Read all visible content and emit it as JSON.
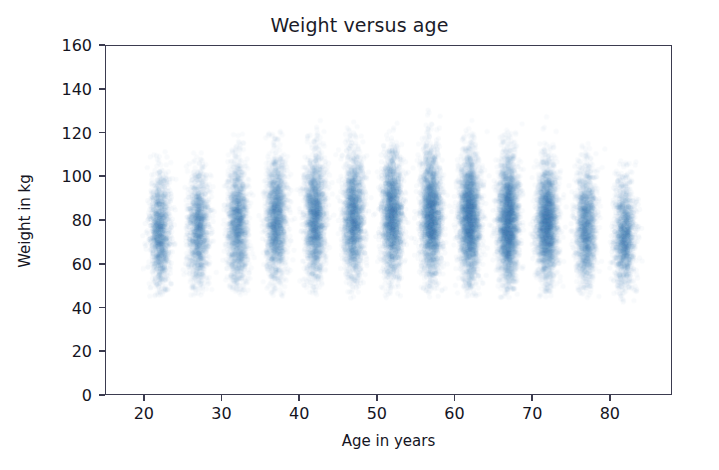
{
  "chart_data": {
    "type": "scatter",
    "title": "Weight versus age",
    "xlabel": "Age in years",
    "ylabel": "Weight in kg",
    "xlim": [
      15,
      88
    ],
    "ylim": [
      0,
      160
    ],
    "xticks": [
      20,
      30,
      40,
      50,
      60,
      70,
      80
    ],
    "xtick_labels": [
      "20",
      "30",
      "40",
      "50",
      "60",
      "70",
      "80"
    ],
    "yticks": [
      0,
      20,
      40,
      60,
      80,
      100,
      120,
      140,
      160
    ],
    "ytick_labels": [
      "0",
      "20",
      "40",
      "60",
      "80",
      "100",
      "120",
      "140",
      "160"
    ],
    "grid": false,
    "legend": null,
    "marker_color": "#2b6cb8",
    "marker_alpha": 0.035,
    "marker_size": 2.6,
    "series": [
      {
        "name": "Weight by age group",
        "groups": [
          {
            "age": 22,
            "n": 1500,
            "mean_weight": 74,
            "sd_weight": 13,
            "min_weight": 45,
            "max_weight": 114
          },
          {
            "age": 27,
            "n": 1450,
            "mean_weight": 76,
            "sd_weight": 13,
            "min_weight": 45,
            "max_weight": 112
          },
          {
            "age": 32,
            "n": 1700,
            "mean_weight": 78,
            "sd_weight": 14,
            "min_weight": 45,
            "max_weight": 120
          },
          {
            "age": 37,
            "n": 1900,
            "mean_weight": 80,
            "sd_weight": 14,
            "min_weight": 45,
            "max_weight": 124
          },
          {
            "age": 42,
            "n": 2050,
            "mean_weight": 81,
            "sd_weight": 14,
            "min_weight": 45,
            "max_weight": 127
          },
          {
            "age": 47,
            "n": 2100,
            "mean_weight": 81,
            "sd_weight": 14,
            "min_weight": 44,
            "max_weight": 128
          },
          {
            "age": 52,
            "n": 2300,
            "mean_weight": 82,
            "sd_weight": 14,
            "min_weight": 44,
            "max_weight": 132
          },
          {
            "age": 57,
            "n": 2600,
            "mean_weight": 82,
            "sd_weight": 14,
            "min_weight": 44,
            "max_weight": 131
          },
          {
            "age": 62,
            "n": 2900,
            "mean_weight": 81,
            "sd_weight": 14,
            "min_weight": 44,
            "max_weight": 132
          },
          {
            "age": 67,
            "n": 2950,
            "mean_weight": 80,
            "sd_weight": 14,
            "min_weight": 44,
            "max_weight": 134
          },
          {
            "age": 72,
            "n": 2600,
            "mean_weight": 79,
            "sd_weight": 13,
            "min_weight": 44,
            "max_weight": 128
          },
          {
            "age": 77,
            "n": 1700,
            "mean_weight": 77,
            "sd_weight": 13,
            "min_weight": 44,
            "max_weight": 116
          },
          {
            "age": 82,
            "n": 1500,
            "mean_weight": 73,
            "sd_weight": 12,
            "min_weight": 42,
            "max_weight": 110
          }
        ]
      }
    ]
  },
  "figure": {
    "background": "#ffffff",
    "axis_color": "#3b3b4f",
    "text_color": "#15151f"
  }
}
